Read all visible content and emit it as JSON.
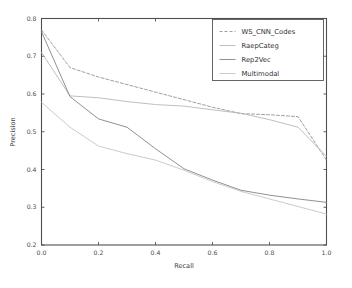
{
  "chart_data": {
    "type": "line",
    "title": "",
    "xlabel": "Recall",
    "ylabel": "Precision",
    "xlim": [
      0.0,
      1.0
    ],
    "ylim": [
      0.2,
      0.8
    ],
    "grid": false,
    "legend_position": "upper right",
    "xticks": [
      "0.0",
      "0.2",
      "0.4",
      "0.6",
      "0.8",
      "1.0"
    ],
    "xtick_values": [
      0.0,
      0.2,
      0.4,
      0.6,
      0.8,
      1.0
    ],
    "yticks": [
      "0.2",
      "0.3",
      "0.4",
      "0.5",
      "0.6",
      "0.7",
      "0.8"
    ],
    "ytick_values": [
      0.2,
      0.3,
      0.4,
      0.5,
      0.6,
      0.7,
      0.8
    ],
    "x": [
      0.0,
      0.1,
      0.2,
      0.3,
      0.4,
      0.5,
      0.6,
      0.7,
      0.8,
      0.9,
      1.0
    ],
    "series": [
      {
        "name": "WS_CNN_Codes",
        "color": "#8d8d8d",
        "dash": "3,2",
        "values": [
          0.77,
          0.67,
          0.645,
          0.625,
          0.605,
          0.585,
          0.565,
          0.548,
          0.545,
          0.54,
          0.425
        ]
      },
      {
        "name": "RaepCateg",
        "color": "#b4b4b4",
        "dash": "none",
        "values": [
          0.71,
          0.595,
          0.59,
          0.58,
          0.572,
          0.568,
          0.558,
          0.549,
          0.532,
          0.512,
          0.435
        ]
      },
      {
        "name": "Rep2Vec",
        "color": "#7d7d7d",
        "dash": "none",
        "values": [
          0.765,
          0.593,
          0.534,
          0.512,
          0.455,
          0.402,
          0.372,
          0.345,
          0.332,
          0.322,
          0.313
        ]
      },
      {
        "name": "Multimodal",
        "color": "#c2c2c2",
        "dash": "none",
        "values": [
          0.578,
          0.512,
          0.462,
          0.442,
          0.425,
          0.398,
          0.368,
          0.342,
          0.322,
          0.302,
          0.282
        ]
      }
    ]
  },
  "legend": {
    "entries": [
      {
        "label": "WS_CNN_Codes"
      },
      {
        "label": "RaepCateg"
      },
      {
        "label": "Rep2Vec"
      },
      {
        "label": "Multimodal"
      }
    ]
  }
}
